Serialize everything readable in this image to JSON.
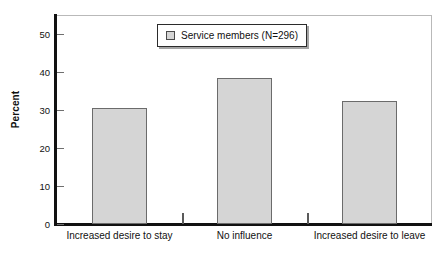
{
  "chart_data": {
    "type": "bar",
    "title": "",
    "xlabel": "",
    "ylabel": "Percent",
    "categories": [
      "Increased desire to stay",
      "No influence",
      "Increased desire to leave"
    ],
    "values": [
      30.5,
      38.4,
      32.4
    ],
    "series": [
      {
        "name": "Service members (N=296)",
        "values": [
          30.5,
          38.4,
          32.4
        ]
      }
    ],
    "ylim": [
      0,
      55
    ],
    "yticks": [
      0,
      10,
      20,
      30,
      40,
      50
    ],
    "ytick_labels": [
      "0",
      "10",
      "20",
      "30",
      "40",
      "50"
    ],
    "grid": false,
    "legend": {
      "position": "top-center",
      "entries": [
        {
          "label": "Service members (N=296)",
          "swatch_color": "#d5d5d5"
        }
      ]
    },
    "colors": {
      "bar_fill": "#d5d5d5",
      "bar_edge": "#6b6b6b",
      "axis": "#111111",
      "frame": "#b9b9b9",
      "text": "#111111"
    }
  }
}
